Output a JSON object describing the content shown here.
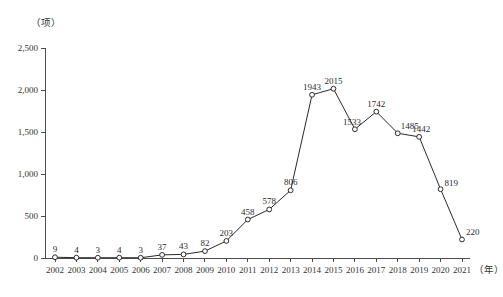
{
  "chart_data": {
    "type": "line",
    "title": "",
    "subtitle": "",
    "xlabel": "（年）",
    "ylabel": "（项）",
    "x": [
      2002,
      2003,
      2004,
      2005,
      2006,
      2007,
      2008,
      2009,
      2010,
      2011,
      2012,
      2013,
      2014,
      2015,
      2016,
      2017,
      2018,
      2019,
      2020,
      2021
    ],
    "categories": [
      "2002",
      "2003",
      "2004",
      "2005",
      "2006",
      "2007",
      "2008",
      "2009",
      "2010",
      "2011",
      "2012",
      "2013",
      "2014",
      "2015",
      "2016",
      "2017",
      "2018",
      "2019",
      "2020",
      "2021"
    ],
    "values": [
      9,
      4,
      3,
      4,
      3,
      37,
      43,
      82,
      203,
      458,
      578,
      806,
      1943,
      2015,
      1533,
      1742,
      1485,
      1442,
      819,
      220
    ],
    "point_labels": [
      "9",
      "4",
      "3",
      "4",
      "3",
      "37",
      "43",
      "82",
      "203",
      "458",
      "578",
      "806",
      "1943",
      "2015",
      "1533",
      "1742",
      "1485",
      "1442",
      "819",
      "220"
    ],
    "ylim": [
      0,
      2500
    ],
    "ytick_values": [
      0,
      500,
      1000,
      1500,
      2000,
      2500
    ],
    "ytick_labels": [
      "0",
      "500",
      "1,000",
      "1,500",
      "2,000",
      "2,500"
    ],
    "grid": false,
    "legend": false,
    "legend_position": "none",
    "marker": "open-circle",
    "line_color": "#2b2b2b",
    "axis_color": "#4d4d4d"
  }
}
